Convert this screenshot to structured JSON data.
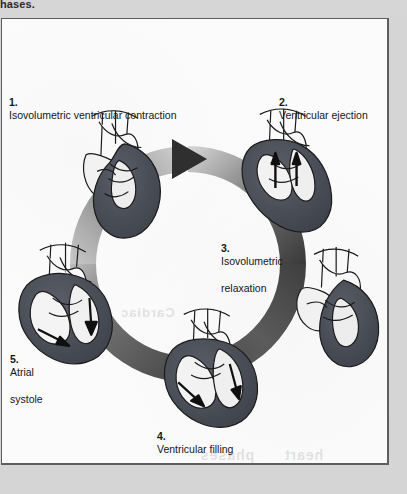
{
  "page": {
    "top_caption_fragment": "hases.",
    "background_color": "#d5d5d5",
    "paper_color": "#fbfbfb",
    "border_color": "#5e5e5e"
  },
  "figure": {
    "ring": {
      "direction": "clockwise",
      "fill_light": "#f0f0f0",
      "fill_dark": "#3c3c3c"
    },
    "heart_colors": {
      "outline": "#1c1c1c",
      "muscle_dark": "#4a4e57",
      "chamber_light": "#f2f2f2",
      "vessel_light": "#fafafa"
    },
    "phases": [
      {
        "number": "1.",
        "label": "Isovolumetric ventricular contraction",
        "label_lines": [
          "Isovolumetric ventricular contraction"
        ],
        "position": "top-left",
        "arrows": "none"
      },
      {
        "number": "2.",
        "label": "Ventricular ejection",
        "label_lines": [
          "Ventricular ejection"
        ],
        "position": "top-right",
        "arrows": "up"
      },
      {
        "number": "3.",
        "label": "Isovolumetric relaxation",
        "label_lines": [
          "Isovolumetric",
          "relaxation"
        ],
        "position": "right",
        "arrows": "none"
      },
      {
        "number": "4.",
        "label": "Ventricular filling",
        "label_lines": [
          "Ventricular filling"
        ],
        "position": "bottom",
        "arrows": "down"
      },
      {
        "number": "5.",
        "label": "Atrial systole",
        "label_lines": [
          "Atrial",
          "systole"
        ],
        "position": "left",
        "arrows": "down"
      }
    ]
  },
  "ghost_text": [
    {
      "text": "Cardiac",
      "left": 120,
      "top": 288,
      "size": 13
    },
    {
      "text": "phases",
      "left": 205,
      "top": 430,
      "size": 14
    },
    {
      "text": "heart",
      "left": 285,
      "top": 430,
      "size": 14
    }
  ]
}
